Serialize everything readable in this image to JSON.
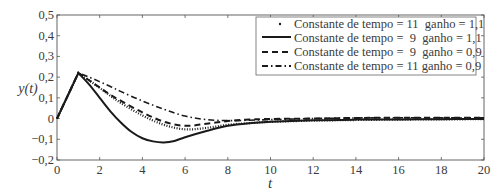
{
  "chart_data": {
    "type": "line",
    "title": "",
    "xlabel": "t",
    "ylabel": "y(t)",
    "xlim": [
      0,
      20
    ],
    "ylim": [
      -0.2,
      0.5
    ],
    "grid": false,
    "legend_position": "upper right",
    "x_ticks": [
      0,
      2,
      4,
      6,
      8,
      10,
      12,
      14,
      16,
      18,
      20
    ],
    "x_tick_labels": [
      "0",
      "2",
      "4",
      "6",
      "8",
      "10",
      "12",
      "14",
      "16",
      "18",
      "20"
    ],
    "y_ticks": [
      -0.2,
      -0.1,
      0,
      0.1,
      0.2,
      0.3,
      0.4,
      0.5
    ],
    "y_tick_labels": [
      "−0,2",
      "−0,1",
      "0",
      "0,1",
      "0,2",
      "0,3",
      "0,4",
      "0,5"
    ],
    "series": [
      {
        "name": "Constante de tempo = 11  ganho = 1,1",
        "style": "dotted",
        "x": [
          0,
          1,
          1.5,
          2,
          2.5,
          3,
          4,
          5,
          6,
          7,
          8,
          9,
          10,
          12,
          14,
          16,
          18,
          20
        ],
        "y": [
          0,
          0.22,
          0.185,
          0.148,
          0.11,
          0.075,
          0.015,
          -0.03,
          -0.052,
          -0.045,
          -0.03,
          -0.022,
          -0.016,
          -0.01,
          -0.007,
          -0.005,
          -0.004,
          -0.003
        ]
      },
      {
        "name": "Constante de tempo =  9  ganho = 1,1",
        "style": "solid",
        "x": [
          0,
          1,
          1.5,
          2,
          2.5,
          3,
          3.5,
          4,
          4.5,
          5,
          5.5,
          6,
          7,
          8,
          9,
          10,
          12,
          14,
          16,
          18,
          20
        ],
        "y": [
          0,
          0.22,
          0.165,
          0.1,
          0.035,
          -0.02,
          -0.065,
          -0.095,
          -0.11,
          -0.115,
          -0.108,
          -0.09,
          -0.06,
          -0.035,
          -0.022,
          -0.015,
          -0.008,
          -0.005,
          -0.004,
          -0.003,
          -0.002
        ]
      },
      {
        "name": "Constante de tempo =  9  ganho = 0,9",
        "style": "dashed",
        "x": [
          0,
          1,
          1.5,
          2,
          2.5,
          3,
          4,
          5,
          6,
          7,
          8,
          9,
          10,
          12,
          14,
          16,
          18,
          20
        ],
        "y": [
          0,
          0.22,
          0.185,
          0.15,
          0.115,
          0.085,
          0.03,
          -0.015,
          -0.035,
          -0.025,
          -0.012,
          -0.005,
          -0.002,
          0.0,
          0.003,
          0.004,
          0.004,
          0.004
        ]
      },
      {
        "name": "Constante de tempo = 11 ganho = 0,9",
        "style": "dashdot",
        "x": [
          0,
          1,
          1.5,
          2,
          2.5,
          3,
          4,
          5,
          6,
          7,
          8,
          9,
          10,
          12,
          14,
          16,
          18,
          20
        ],
        "y": [
          0,
          0.22,
          0.2,
          0.178,
          0.155,
          0.13,
          0.085,
          0.045,
          0.012,
          -0.005,
          -0.01,
          -0.008,
          -0.005,
          0.0,
          0.003,
          0.004,
          0.004,
          0.004
        ]
      }
    ]
  },
  "legend": {
    "entries": [
      "Constante de tempo = 11  ganho = 1,1",
      "Constante de tempo =  9  ganho = 1,1",
      "Constante de tempo =  9  ganho = 0,9",
      "Constante de tempo = 11 ganho = 0,9"
    ]
  },
  "axes": {
    "xlabel": "t",
    "ylabel": "y(t)"
  },
  "colors": {
    "line": "#1a1a1a",
    "axis": "#555555",
    "text": "#3a3a3a"
  }
}
